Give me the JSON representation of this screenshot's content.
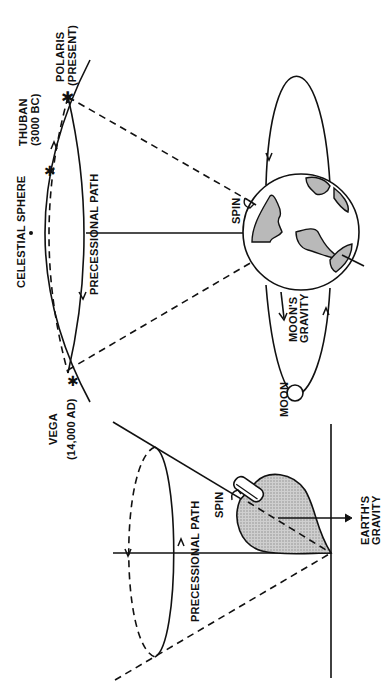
{
  "figure": {
    "colors": {
      "ink": "#111111",
      "shading": "#b9b9b9",
      "background": "#ffffff"
    }
  },
  "earth_panel": {
    "celestial_sphere_label": "CELESTIAL SPHERE",
    "precessional_path_label": "PRECESSIONAL PATH",
    "stars": [
      {
        "name": "POLARIS",
        "note": "(PRESENT)"
      },
      {
        "name": "THUBAN",
        "note": "(3000 BC)"
      },
      {
        "name": "VEGA",
        "note": "(14,000 AD)"
      }
    ],
    "spin_label": "SPIN",
    "moons_gravity_label": "MOON'S GRAVITY",
    "moons_gravity_lines": [
      "MOON'S",
      "GRAVITY"
    ],
    "moon_label": "MOON"
  },
  "top_panel": {
    "precessional_path_label": "PRECESSIONAL PATH",
    "spin_label": "SPIN",
    "earths_gravity_lines": [
      "EARTH'S",
      "GRAVITY"
    ]
  }
}
